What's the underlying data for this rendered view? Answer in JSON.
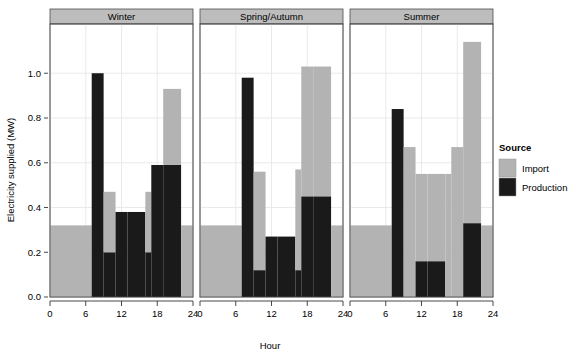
{
  "chart_data": {
    "type": "bar",
    "title": "",
    "subtitle": "",
    "xlabel": "Hour",
    "ylabel": "Electricity supplied (MW)",
    "xlim": [
      0,
      24
    ],
    "ylim": [
      0,
      1.22
    ],
    "xticks": [
      0,
      6,
      12,
      18,
      24
    ],
    "xtick_labels": [
      "0",
      "6",
      "12",
      "18",
      "24"
    ],
    "yticks": [
      0.0,
      0.2,
      0.4,
      0.6,
      0.8,
      1.0
    ],
    "ytick_labels": [
      "0.0",
      "0.2",
      "0.4",
      "0.6",
      "0.8",
      "1.0"
    ],
    "grid": true,
    "stacked": true,
    "legend": {
      "title": "Source",
      "position": "right",
      "entries": [
        {
          "name": "Import",
          "color": "#b3b3b3"
        },
        {
          "name": "Production",
          "color": "#1a1a1a"
        }
      ]
    },
    "facet_variable": "Season",
    "panels": [
      {
        "label": "Winter",
        "bins": [
          {
            "x0": 0,
            "x1": 7,
            "production": 0.0,
            "import": 0.32
          },
          {
            "x0": 7,
            "x1": 9,
            "production": 1.0,
            "import": 0.0
          },
          {
            "x0": 9,
            "x1": 11,
            "production": 0.2,
            "import": 0.27
          },
          {
            "x0": 11,
            "x1": 13,
            "production": 0.38,
            "import": 0.0
          },
          {
            "x0": 13,
            "x1": 16,
            "production": 0.38,
            "import": 0.0
          },
          {
            "x0": 16,
            "x1": 17,
            "production": 0.2,
            "import": 0.27
          },
          {
            "x0": 17,
            "x1": 19,
            "production": 0.59,
            "import": 0.0
          },
          {
            "x0": 19,
            "x1": 22,
            "production": 0.59,
            "import": 0.34
          },
          {
            "x0": 22,
            "x1": 24,
            "production": 0.0,
            "import": 0.32
          }
        ]
      },
      {
        "label": "Spring/Autumn",
        "bins": [
          {
            "x0": 0,
            "x1": 7,
            "production": 0.0,
            "import": 0.32
          },
          {
            "x0": 7,
            "x1": 9,
            "production": 0.98,
            "import": 0.0
          },
          {
            "x0": 9,
            "x1": 11,
            "production": 0.12,
            "import": 0.44
          },
          {
            "x0": 11,
            "x1": 13,
            "production": 0.27,
            "import": 0.0
          },
          {
            "x0": 13,
            "x1": 16,
            "production": 0.27,
            "import": 0.0
          },
          {
            "x0": 16,
            "x1": 17,
            "production": 0.12,
            "import": 0.45
          },
          {
            "x0": 17,
            "x1": 19,
            "production": 0.45,
            "import": 0.58
          },
          {
            "x0": 19,
            "x1": 22,
            "production": 0.45,
            "import": 0.58
          },
          {
            "x0": 22,
            "x1": 24,
            "production": 0.0,
            "import": 0.32
          }
        ]
      },
      {
        "label": "Summer",
        "bins": [
          {
            "x0": 0,
            "x1": 7,
            "production": 0.0,
            "import": 0.32
          },
          {
            "x0": 7,
            "x1": 9,
            "production": 0.84,
            "import": 0.0
          },
          {
            "x0": 9,
            "x1": 11,
            "production": 0.0,
            "import": 0.67
          },
          {
            "x0": 11,
            "x1": 13,
            "production": 0.16,
            "import": 0.39
          },
          {
            "x0": 13,
            "x1": 16,
            "production": 0.16,
            "import": 0.39
          },
          {
            "x0": 16,
            "x1": 17,
            "production": 0.0,
            "import": 0.55
          },
          {
            "x0": 17,
            "x1": 19,
            "production": 0.0,
            "import": 0.67
          },
          {
            "x0": 19,
            "x1": 22,
            "production": 0.33,
            "import": 0.81
          },
          {
            "x0": 22,
            "x1": 24,
            "production": 0.0,
            "import": 0.32
          }
        ]
      }
    ]
  },
  "style": {
    "import_color": "#b3b3b3",
    "production_color": "#1a1a1a",
    "strip_fill": "#bdbdbd",
    "panel_border": "#4d4d4d",
    "grid_color": "#e8e8e8",
    "background": "#ffffff"
  }
}
